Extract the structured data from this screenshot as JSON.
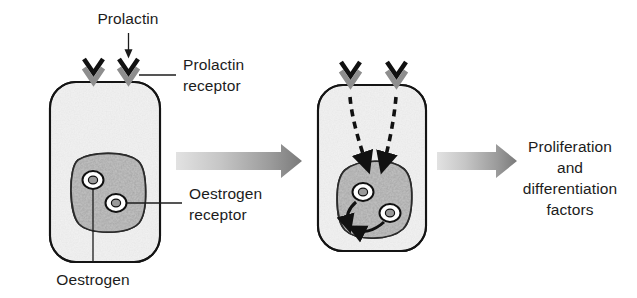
{
  "figure": {
    "background_color": "#ffffff",
    "text_color": "#1c1c1c"
  },
  "labels": {
    "prolactin": "Prolactin",
    "prolactin_receptor_line1": "Prolactin",
    "prolactin_receptor_line2": "receptor",
    "oestrogen_receptor_line1": "Oestrogen",
    "oestrogen_receptor_line2": "receptor",
    "oestrogen": "Oestrogen",
    "outcome_line1": "Proliferation",
    "outcome_line2": "and",
    "outcome_line3": "differentiation",
    "outcome_line4": "factors"
  },
  "colors": {
    "cell_outline": "#141414",
    "cytoplasm_fill": "#f0f0f0",
    "nucleus_fill": "#b8b8b8",
    "nucleus_outline": "#2b2b2b",
    "receptor_gray": "#8e8e8e",
    "ligand_black": "#111111",
    "arrow_gradient_light": "#d6d6d6",
    "arrow_gradient_dark": "#7b7b7b",
    "dashed_arrow": "#111111"
  },
  "cells": [
    {
      "name": "resting-cell",
      "state": "resting",
      "x": 50,
      "y": 82,
      "width": 110,
      "height": 180,
      "receptor_count": 2,
      "nucleus": {
        "x": 72,
        "y": 155,
        "width": 72,
        "height": 78
      },
      "oestrogen_receptors": 2,
      "has_dashed_signal": false,
      "has_curved_arrows": false
    },
    {
      "name": "activated-cell",
      "state": "activated",
      "x": 318,
      "y": 85,
      "width": 108,
      "height": 166,
      "receptor_count": 2,
      "nucleus": {
        "x": 337,
        "y": 162,
        "width": 72,
        "height": 76
      },
      "oestrogen_receptors": 2,
      "has_dashed_signal": true,
      "has_curved_arrows": true
    }
  ],
  "icons": {
    "prolactin_receptor": "chevron-v-icon",
    "prolactin_ligand": "chevron-v-icon",
    "oestrogen_receptor": "ring-icon",
    "oestrogen": "ring-core-icon",
    "transduction": "dashed-arrow-icon",
    "transcription": "curved-arrow-icon",
    "progression": "gradient-arrow-icon"
  },
  "flow_arrows": [
    {
      "name": "arrow-resting-to-activated",
      "x1": 172,
      "y1": 160,
      "x2": 300,
      "y2": 160
    },
    {
      "name": "arrow-activated-to-outcome",
      "x1": 437,
      "y1": 160,
      "x2": 515,
      "y2": 160
    }
  ]
}
